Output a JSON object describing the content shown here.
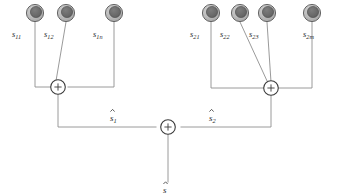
{
  "diagram": {
    "colors": {
      "background": "#ffffff",
      "wire": "#8e8e8e",
      "node_outer_ring": "#b8b8b8",
      "node_inner_disc": "#6b6b6b",
      "node_outline": "#4a4a4a",
      "summer_outline": "#3a3a3a",
      "text": "#2b2b2b"
    },
    "groups": [
      {
        "name": "group-1",
        "summer_label": "+",
        "output_label_base": "s",
        "output_label_sub": "1",
        "output_label_accent": "hat",
        "sources": [
          {
            "name": "source-s11",
            "base": "s",
            "sub": "11",
            "cx": 35,
            "cy": 13,
            "routing": "orthogonal-left"
          },
          {
            "name": "source-s12",
            "base": "s",
            "sub": "12",
            "cx": 66,
            "cy": 13,
            "routing": "diagonal"
          },
          {
            "name": "source-s1n",
            "base": "s",
            "sub": "1n",
            "cx": 114,
            "cy": 13,
            "routing": "orthogonal-right"
          }
        ]
      },
      {
        "name": "group-2",
        "summer_label": "+",
        "output_label_base": "s",
        "output_label_sub": "2",
        "output_label_accent": "hat",
        "sources": [
          {
            "name": "source-s21",
            "base": "s",
            "sub": "21",
            "cx": 211,
            "cy": 13,
            "routing": "orthogonal-left"
          },
          {
            "name": "source-s22",
            "base": "s",
            "sub": "22",
            "cx": 240,
            "cy": 13,
            "routing": "diagonal"
          },
          {
            "name": "source-s23",
            "base": "s",
            "sub": "23",
            "cx": 267,
            "cy": 13,
            "routing": "diagonal"
          },
          {
            "name": "source-s2m",
            "base": "s",
            "sub": "2m",
            "cx": 312,
            "cy": 13,
            "routing": "orthogonal-right"
          }
        ]
      }
    ],
    "final_summer": {
      "name": "final-summer",
      "label": "+",
      "output_label_base": "s",
      "output_label_sub": "",
      "output_label_accent": "hat"
    }
  }
}
